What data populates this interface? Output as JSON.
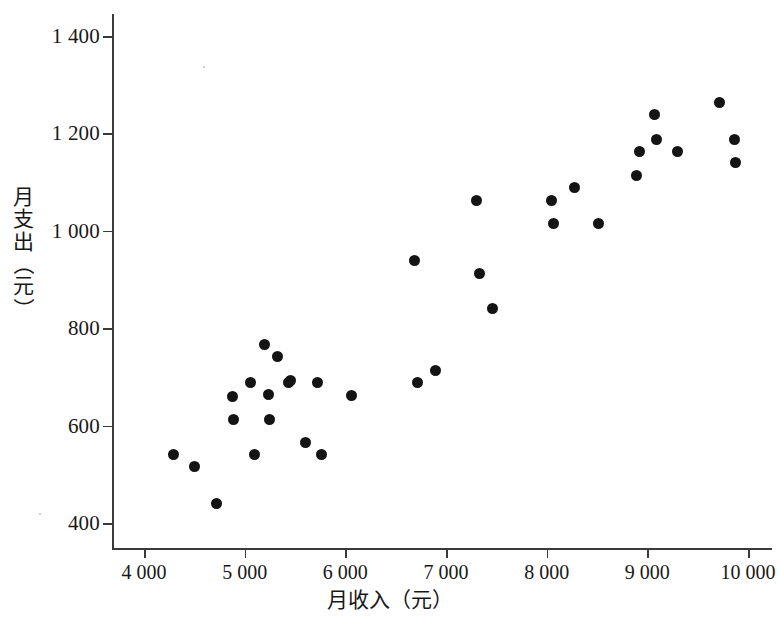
{
  "figure": {
    "background_color": "#ffffff",
    "marker_color": "#141414",
    "axis_color": "#3a3a3a"
  },
  "axes": {
    "x_label": "月收入（元）",
    "y_label_chars": [
      "月",
      "支",
      "出",
      "（",
      "元",
      "）"
    ],
    "y_label": "月支出（元）"
  },
  "chart_data": {
    "type": "scatter",
    "title": "",
    "xlabel": "月收入（元）",
    "ylabel": "月支出（元）",
    "xlim": [
      3680,
      10290
    ],
    "ylim": [
      345,
      1460
    ],
    "grid": false,
    "legend": null,
    "x_ticks": [
      4000,
      5000,
      6000,
      7000,
      8000,
      9000,
      10000
    ],
    "x_tick_labels": [
      "4 000",
      "5 000",
      "6 000",
      "7 000",
      "8 000",
      "9 000",
      "10 000"
    ],
    "y_ticks": [
      400,
      600,
      800,
      1000,
      1200,
      1400
    ],
    "y_tick_labels": [
      "400",
      "600",
      "800",
      "1 000",
      "1 200",
      "1 400"
    ],
    "point_count": 36,
    "points": [
      [
        4290,
        540
      ],
      [
        4500,
        515
      ],
      [
        4720,
        440
      ],
      [
        4880,
        660
      ],
      [
        4890,
        613
      ],
      [
        5060,
        688
      ],
      [
        5100,
        540
      ],
      [
        5200,
        767
      ],
      [
        5240,
        663
      ],
      [
        5250,
        613
      ],
      [
        5330,
        742
      ],
      [
        5440,
        688
      ],
      [
        5460,
        693
      ],
      [
        5600,
        565
      ],
      [
        5720,
        688
      ],
      [
        5760,
        540
      ],
      [
        6060,
        662
      ],
      [
        6690,
        938
      ],
      [
        6720,
        688
      ],
      [
        6900,
        713
      ],
      [
        7300,
        1063
      ],
      [
        7330,
        913
      ],
      [
        7460,
        840
      ],
      [
        8050,
        1063
      ],
      [
        8070,
        1015
      ],
      [
        8280,
        1088
      ],
      [
        8510,
        1015
      ],
      [
        8890,
        1113
      ],
      [
        8920,
        1163
      ],
      [
        9070,
        1238
      ],
      [
        9090,
        1188
      ],
      [
        9300,
        1163
      ],
      [
        9720,
        1263
      ],
      [
        9870,
        1188
      ],
      [
        9880,
        1140
      ]
    ]
  }
}
